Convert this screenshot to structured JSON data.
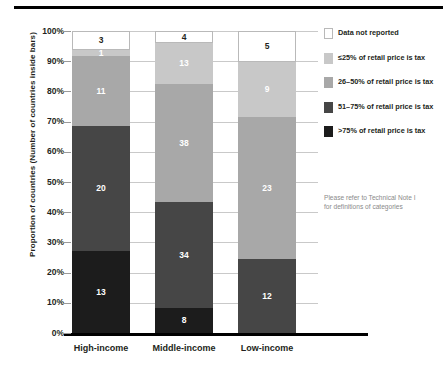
{
  "chart_data": {
    "type": "bar",
    "subtype": "stacked-100-percent",
    "title": "",
    "xlabel": "",
    "ylabel": "Proportion of countries (Number of countries inside bars)",
    "ylim": [
      0,
      100
    ],
    "ytick_labels": [
      "100%",
      "90%",
      "80%",
      "70%",
      "60%",
      "50%",
      "40%",
      "30%",
      "20%",
      "10%",
      "0%"
    ],
    "ytick_values": [
      100,
      90,
      80,
      70,
      60,
      50,
      40,
      30,
      20,
      10,
      0
    ],
    "grid": true,
    "legend_position": "right",
    "categories": [
      "High-income",
      "Middle-income",
      "Low-income"
    ],
    "series": [
      {
        "name": "Data not reported",
        "color": "#ffffff",
        "values": [
          3,
          4,
          5
        ],
        "percents": [
          6.3,
          4.1,
          10.2
        ]
      },
      {
        "name": "≤25% of retail price is tax",
        "color": "#c8c8c8",
        "values": [
          1,
          13,
          9
        ],
        "percents": [
          2.1,
          13.4,
          18.4
        ]
      },
      {
        "name": "26–50% of retail price is tax",
        "color": "#a8a8a8",
        "values": [
          11,
          38,
          23
        ],
        "percents": [
          22.9,
          39.2,
          46.9
        ]
      },
      {
        "name": "51–75% of retail price is tax",
        "color": "#464646",
        "values": [
          20,
          34,
          12
        ],
        "percents": [
          41.7,
          35.0,
          24.5
        ]
      },
      {
        "name": ">75% of retail price is tax",
        "color": "#1c1c1c",
        "values": [
          13,
          8,
          0
        ],
        "percents": [
          27.0,
          8.3,
          0
        ]
      }
    ],
    "annotations": [
      "Please refer to Technical Note I for definitions of categories"
    ]
  },
  "legend": {
    "items": [
      {
        "label": "Data not reported",
        "swatch": "#ffffff",
        "swatch_class": "c-none"
      },
      {
        "label": "≤25% of retail price is tax",
        "swatch": "#c8c8c8",
        "swatch_class": "c-lt25"
      },
      {
        "label": "26–50% of retail price is tax",
        "swatch": "#a8a8a8",
        "swatch_class": "c-26_50"
      },
      {
        "label": "51–75% of retail price is tax",
        "swatch": "#464646",
        "swatch_class": "c-51_75"
      },
      {
        "label": ">75% of retail price is tax",
        "swatch": "#1c1c1c",
        "swatch_class": "c-gt75"
      }
    ],
    "note_line1": "Please refer to Technical Note I",
    "note_line2": "for definitions of categories"
  },
  "axes": {
    "ylabel": "Proportion of countries (Number of countries inside bars)",
    "yticks": [
      "100%",
      "90%",
      "80%",
      "70%",
      "60%",
      "50%",
      "40%",
      "30%",
      "20%",
      "10%",
      "0%"
    ],
    "xticks": [
      "High-income",
      "Middle-income",
      "Low-income"
    ]
  },
  "bars": {
    "high_income": {
      "label": "High-income",
      "segments": [
        {
          "value": "3",
          "percent": 6.3,
          "class": "c-none"
        },
        {
          "value": "1",
          "percent": 2.1,
          "class": "c-lt25"
        },
        {
          "value": "11",
          "percent": 22.9,
          "class": "c-26_50"
        },
        {
          "value": "20",
          "percent": 41.7,
          "class": "c-51_75"
        },
        {
          "value": "13",
          "percent": 27.0,
          "class": "c-gt75"
        }
      ]
    },
    "middle_income": {
      "label": "Middle-income",
      "segments": [
        {
          "value": "4",
          "percent": 4.1,
          "class": "c-none"
        },
        {
          "value": "13",
          "percent": 13.4,
          "class": "c-lt25"
        },
        {
          "value": "38",
          "percent": 39.2,
          "class": "c-26_50"
        },
        {
          "value": "34",
          "percent": 35.0,
          "class": "c-51_75"
        },
        {
          "value": "8",
          "percent": 8.3,
          "class": "c-gt75"
        }
      ]
    },
    "low_income": {
      "label": "Low-income",
      "segments": [
        {
          "value": "5",
          "percent": 10.2,
          "class": "c-none"
        },
        {
          "value": "9",
          "percent": 18.4,
          "class": "c-lt25"
        },
        {
          "value": "23",
          "percent": 46.9,
          "class": "c-26_50"
        },
        {
          "value": "12",
          "percent": 24.5,
          "class": "c-51_75"
        }
      ]
    }
  }
}
